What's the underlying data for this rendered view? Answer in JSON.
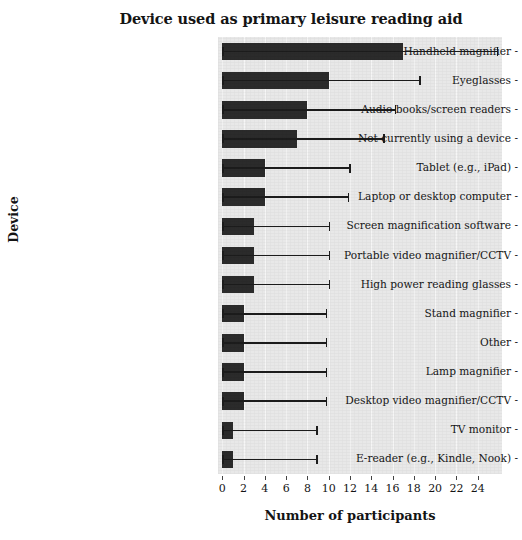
{
  "chart_data": {
    "type": "bar",
    "orientation": "horizontal",
    "title": "Device used as primary leisure reading aid",
    "xlabel": "Number of participants",
    "ylabel": "Device",
    "xlim": [
      0,
      25.8
    ],
    "xticks": [
      0,
      2,
      4,
      6,
      8,
      10,
      12,
      14,
      16,
      18,
      20,
      22,
      24
    ],
    "xtick_labels": [
      "0",
      "2",
      "4",
      "6",
      "8",
      "10",
      "12",
      "14",
      "16",
      "18",
      "20",
      "22",
      "24"
    ],
    "grid": "vertical",
    "legend": "none",
    "bar_color": "#2b2b2b",
    "plot_background": "#e8e8e8",
    "categories": [
      "Handheld magnifier",
      "Eyeglasses",
      "Audio books/screen readers",
      "Not currently using a device",
      "Tablet (e.g., iPad)",
      "Laptop or desktop computer",
      "Screen magnification software",
      "Portable video magnifier/CCTV",
      "High power reading glasses",
      "Stand magnifier",
      "Other",
      "Lamp magnifier",
      "Desktop video magnifier/CCTV",
      "TV monitor",
      "E-reader (e.g., Kindle, Nook)"
    ],
    "values": [
      17,
      10,
      8,
      7,
      4,
      4,
      3,
      3,
      3,
      2,
      2,
      2,
      2,
      1,
      1
    ],
    "error_upper": [
      25.8,
      18.5,
      16.2,
      15.1,
      11.9,
      11.8,
      10.0,
      10.0,
      10.0,
      9.7,
      9.7,
      9.7,
      9.7,
      8.8,
      8.8
    ]
  },
  "axis": {
    "title": "Device used as primary leisure reading aid",
    "xlabel": "Number of participants",
    "ylabel": "Device"
  }
}
